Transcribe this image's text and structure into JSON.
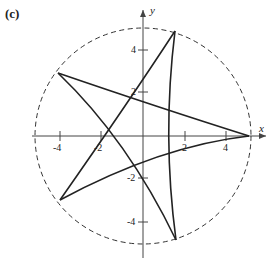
{
  "panel_label": "(c)",
  "axes": {
    "x_label": "x",
    "y_label": "y",
    "x_ticks": [
      {
        "value": -4,
        "label": "-4",
        "px": 60
      },
      {
        "value": -2,
        "label": "-2",
        "px": 101
      },
      {
        "value": 2,
        "label": "2",
        "px": 185
      },
      {
        "value": 4,
        "label": "4",
        "px": 226
      }
    ],
    "y_ticks": [
      {
        "value": 4,
        "label": "4",
        "py": 50
      },
      {
        "value": 2,
        "label": "2",
        "py": 92
      },
      {
        "value": -2,
        "label": "-2",
        "py": 178
      },
      {
        "value": -4,
        "label": "-4",
        "py": 222
      }
    ]
  },
  "circle": {
    "style": "dashed",
    "radius_units": 5.2
  },
  "curve": {
    "type": "five-pointed star curve (pentagram-like closed curve)",
    "vertices": [
      {
        "name": "right",
        "x": 5.1,
        "y": 0
      },
      {
        "name": "top",
        "x": 1.55,
        "y": 5.0
      },
      {
        "name": "upper-left",
        "x": -4.1,
        "y": 3.0
      },
      {
        "name": "lower-left",
        "x": -4.0,
        "y": -3.0
      },
      {
        "name": "bottom",
        "x": 1.6,
        "y": -5.0
      }
    ]
  },
  "colors": {
    "stroke": "#222222",
    "axis": "#444444"
  }
}
